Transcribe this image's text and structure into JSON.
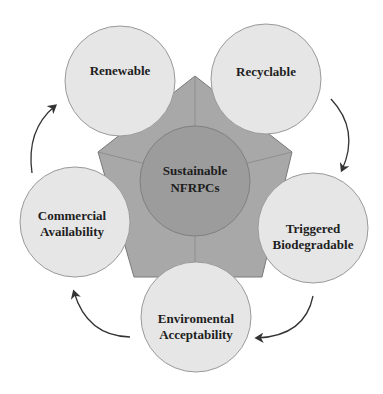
{
  "diagram": {
    "center": {
      "line1": "Sustainable",
      "line2": "NFRPCs"
    },
    "nodes": [
      {
        "id": "renewable",
        "line1": "Renewable",
        "line2": ""
      },
      {
        "id": "recyclable",
        "line1": "Recyclable",
        "line2": ""
      },
      {
        "id": "triggered",
        "line1": "Triggered",
        "line2": "Biodegradable"
      },
      {
        "id": "enviromental",
        "line1": "Enviromental",
        "line2": "Acceptability"
      },
      {
        "id": "commercial",
        "line1": "Commercial",
        "line2": "Availability"
      }
    ],
    "colors": {
      "outer_circle_fill": "#e6e6e6",
      "outer_circle_stroke": "#9a9a9a",
      "pentagon_fill": "#a8a8a8",
      "pentagon_stroke": "#7a7a7a",
      "center_fill": "#9c9c9c",
      "arrow": "#333333"
    }
  }
}
